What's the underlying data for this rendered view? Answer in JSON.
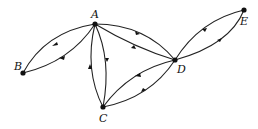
{
  "diagram": {
    "type": "directed-graph",
    "nodes": [
      {
        "id": "A",
        "label": "A",
        "x": 95,
        "y": 24
      },
      {
        "id": "B",
        "label": "B",
        "x": 23,
        "y": 73
      },
      {
        "id": "C",
        "label": "C",
        "x": 103,
        "y": 107
      },
      {
        "id": "D",
        "label": "D",
        "x": 175,
        "y": 60
      },
      {
        "id": "E",
        "label": "E",
        "x": 244,
        "y": 10
      }
    ],
    "edges": [
      {
        "from": "A",
        "to": "B"
      },
      {
        "from": "B",
        "to": "A"
      },
      {
        "from": "C",
        "to": "A"
      },
      {
        "from": "A",
        "to": "C"
      },
      {
        "from": "A",
        "to": "D"
      },
      {
        "from": "D",
        "to": "A"
      },
      {
        "from": "D",
        "to": "C"
      },
      {
        "from": "C",
        "to": "D"
      },
      {
        "from": "D",
        "to": "E"
      },
      {
        "from": "E",
        "to": "D"
      }
    ]
  }
}
